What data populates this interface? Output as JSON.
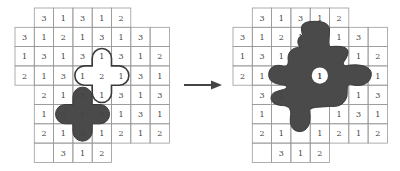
{
  "diagram": {
    "cell_size": 19.3,
    "colors": {
      "grid_line": "#9a9a9a",
      "text": "#444444",
      "shape_fill": "#4a4a4a",
      "outline": "#3a3a3a",
      "arrow": "#444444",
      "background": "#ffffff"
    },
    "left_grid": {
      "origin_x": 15,
      "origin_y": 8,
      "rows": [
        {
          "start": 1,
          "cells": [
            "3",
            "1",
            "3",
            "1",
            "2"
          ]
        },
        {
          "start": 0,
          "cells": [
            "3",
            "1",
            "2",
            "1",
            "3",
            "1",
            "3",
            ""
          ]
        },
        {
          "start": 0,
          "cells": [
            "1",
            "3",
            "1",
            "3",
            "1",
            "3",
            "1",
            "2"
          ]
        },
        {
          "start": 0,
          "cells": [
            "2",
            "1",
            "3",
            "1",
            "2",
            "1",
            "3",
            "1"
          ]
        },
        {
          "start": 1,
          "cells": [
            "2",
            "1",
            "3",
            "1",
            "3",
            "1",
            "3"
          ]
        },
        {
          "start": 1,
          "cells": [
            "1",
            "3",
            "1",
            "3",
            "1",
            "3",
            "1"
          ]
        },
        {
          "start": 1,
          "cells": [
            "2",
            "1",
            "3",
            "1",
            "2",
            "1",
            "2"
          ]
        },
        {
          "start": 1,
          "cells": [
            "",
            "3",
            "1",
            "2"
          ]
        }
      ],
      "outline_cross": {
        "center_row": 3,
        "center_col": 4
      },
      "filled_cross": {
        "center_row": 5,
        "center_col": 3
      }
    },
    "arrow": {
      "from_x": 184,
      "to_x": 222,
      "y": 85,
      "direction": "right"
    },
    "right_grid": {
      "origin_x": 233,
      "origin_y": 8,
      "rows": [
        {
          "start": 1,
          "cells": [
            "3",
            "1",
            "3",
            "1",
            "2"
          ]
        },
        {
          "start": 0,
          "cells": [
            "3",
            "1",
            "2",
            "1",
            "",
            "1",
            "3",
            ""
          ]
        },
        {
          "start": 0,
          "cells": [
            "1",
            "3",
            "1",
            "",
            "",
            "",
            "1",
            "2"
          ]
        },
        {
          "start": 0,
          "cells": [
            "2",
            "1",
            "",
            "",
            "1",
            "",
            "",
            "1"
          ]
        },
        {
          "start": 1,
          "cells": [
            "3",
            "1",
            "",
            "",
            "",
            "1",
            "3"
          ]
        },
        {
          "start": 1,
          "cells": [
            "1",
            "",
            "",
            "",
            "1",
            "3",
            "1"
          ]
        },
        {
          "start": 1,
          "cells": [
            "2",
            "1",
            "",
            "1",
            "2",
            "1",
            "2"
          ]
        },
        {
          "start": 1,
          "cells": [
            "",
            "3",
            "1",
            "2"
          ]
        }
      ],
      "merged_shape": {
        "hole_row": 3,
        "hole_col": 4,
        "hole_label": "1"
      }
    }
  }
}
